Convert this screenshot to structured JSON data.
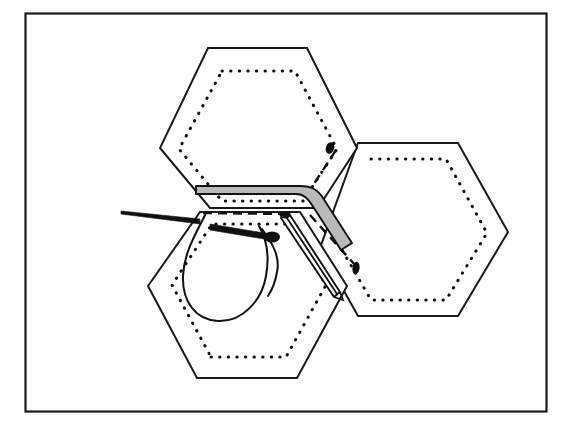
{
  "figure": {
    "border_color": "#1a1a1a",
    "paper_color": "#ffffff",
    "ink_color": "#111111",
    "seam_shade_color": "#b9b9b9",
    "frame": {
      "x": 25,
      "y": 13,
      "width": 522,
      "height": 399
    }
  },
  "diagram": {
    "type": "line-illustration",
    "elements": [
      {
        "name": "hexagon-patch-top",
        "role": "fabric patch",
        "fill": "#ffffff"
      },
      {
        "name": "hexagon-patch-bottom",
        "role": "fabric patch",
        "fill": "#ffffff"
      },
      {
        "name": "hexagon-patch-right",
        "role": "fabric patch",
        "fill": "#ffffff"
      },
      {
        "name": "paper-template-outline",
        "role": "dotted template edge",
        "style": "dotted"
      },
      {
        "name": "seam-allowance-folded",
        "role": "shaded folded edge",
        "fill": "#b9b9b9"
      },
      {
        "name": "seam-allowance-open",
        "role": "white folded edge",
        "fill": "#ffffff"
      },
      {
        "name": "fold-line-dashed",
        "role": "hidden fold line",
        "style": "dashed"
      },
      {
        "name": "sewing-needle",
        "role": "needle passing through fabric"
      },
      {
        "name": "thread-loop",
        "role": "trailing thread loop"
      },
      {
        "name": "stitch-marks",
        "role": "dark stitch dots",
        "count": 2
      }
    ],
    "hexagons": {
      "top": [
        [
          208,
          48
        ],
        [
          307,
          48
        ],
        [
          357,
          148
        ],
        [
          307,
          224
        ],
        [
          208,
          224
        ],
        [
          160,
          148
        ]
      ],
      "bottom": [
        [
          197,
          378
        ],
        [
          297,
          378
        ],
        [
          347,
          286
        ],
        [
          297,
          205
        ],
        [
          197,
          205
        ],
        [
          148,
          286
        ]
      ],
      "right": [
        [
          358,
          143
        ],
        [
          458,
          143
        ],
        [
          508,
          232
        ],
        [
          458,
          316
        ],
        [
          358,
          316
        ],
        [
          309,
          232
        ]
      ]
    },
    "needle": {
      "entry_point": [
        122,
        212
      ],
      "exit_point": [
        283,
        228
      ],
      "orientation": "left-to-right, slightly downward"
    }
  }
}
